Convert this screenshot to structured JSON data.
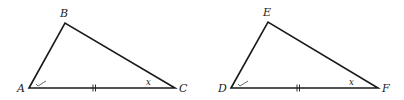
{
  "figure": {
    "stroke_color": "#1a1a1a",
    "triangles": [
      {
        "name": "ABC",
        "vertices": {
          "A": {
            "label": "A",
            "x": 29,
            "y": 88,
            "lx": 18,
            "ly": 92
          },
          "B": {
            "label": "B",
            "x": 65,
            "y": 23,
            "lx": 60,
            "ly": 16
          },
          "C": {
            "label": "C",
            "x": 175,
            "y": 88,
            "lx": 180,
            "ly": 92
          }
        },
        "angle_mark_at_A": "check",
        "angle_mark_at_C": {
          "label": "x",
          "x": 147,
          "y": 85
        },
        "side_AC_tick": "double",
        "tick_x": 94
      },
      {
        "name": "DEF",
        "vertices": {
          "D": {
            "label": "D",
            "x": 231,
            "y": 88,
            "lx": 219,
            "ly": 92
          },
          "E": {
            "label": "E",
            "x": 268,
            "y": 22,
            "lx": 263,
            "ly": 15
          },
          "F": {
            "label": "F",
            "x": 378,
            "y": 88,
            "lx": 383,
            "ly": 92
          }
        },
        "angle_mark_at_D": "check",
        "angle_mark_at_F": {
          "label": "x",
          "x": 350,
          "y": 85
        },
        "side_DF_tick": "double",
        "tick_x": 298
      }
    ]
  },
  "labels": {
    "A": "A",
    "B": "B",
    "C": "C",
    "D": "D",
    "E": "E",
    "F": "F",
    "angle_x_1": "x",
    "angle_x_2": "x"
  }
}
